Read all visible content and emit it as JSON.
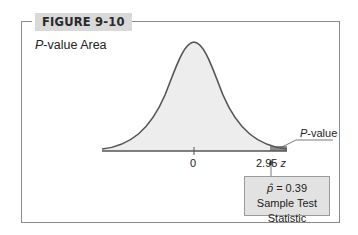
{
  "figure": {
    "label": "FIGURE 9-10",
    "title_italic": "P",
    "title_rest": "-value Area"
  },
  "plot": {
    "curve": "standard normal density",
    "axis_ticks": [
      {
        "label": "0",
        "z": 0
      },
      {
        "label": "2.95",
        "z": 2.95
      }
    ],
    "axis_variable": "z",
    "shaded_region_label_italic": "P",
    "shaded_region_label_rest": "-value",
    "shaded_region": "right tail beyond z = 2.95"
  },
  "stat_box": {
    "symbol": "p̂",
    "equation": "= 0.39",
    "caption": "Sample Test Statistic"
  },
  "colors": {
    "frame": "#8a8a8a",
    "badge_bg": "#d9d9d9",
    "curve_fill": "#ededed",
    "curve_stroke": "#555555",
    "tail_fill": "#8c8c8c",
    "box_bg": "#e2e2e2"
  }
}
